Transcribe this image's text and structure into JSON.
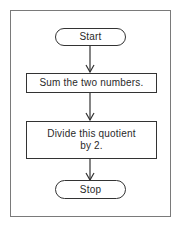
{
  "flowchart": {
    "nodes": [
      {
        "id": "start",
        "type": "terminator",
        "label": "Start"
      },
      {
        "id": "step1",
        "type": "process",
        "label": "Sum the two numbers."
      },
      {
        "id": "step2",
        "type": "process",
        "label_line1": "Divide this quotient",
        "label_line2": "by 2."
      },
      {
        "id": "stop",
        "type": "terminator",
        "label": "Stop"
      }
    ],
    "edges": [
      {
        "from": "start",
        "to": "step1"
      },
      {
        "from": "step1",
        "to": "step2"
      },
      {
        "from": "step2",
        "to": "stop"
      }
    ]
  }
}
